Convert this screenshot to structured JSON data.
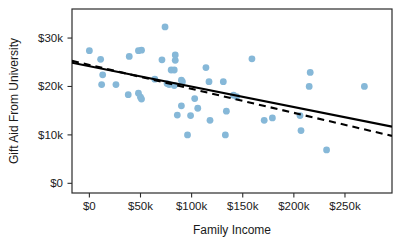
{
  "chart_data": {
    "type": "scatter",
    "title": "",
    "xlabel": "Family Income",
    "ylabel": "Gift Aid From University",
    "xlim": [
      -17000,
      296000
    ],
    "ylim": [
      -2000,
      36000
    ],
    "grid": false,
    "legend": null,
    "x_ticks": [
      0,
      50000,
      100000,
      150000,
      200000,
      250000
    ],
    "x_tick_labels": [
      "$0",
      "$50k",
      "$100k",
      "$150k",
      "$200k",
      "$250k"
    ],
    "y_ticks": [
      0,
      10000,
      20000,
      30000
    ],
    "y_tick_labels": [
      "$0",
      "$10k",
      "$20k",
      "$30k"
    ],
    "point_color": "#86b8d8",
    "point_radius": 3.4,
    "points": [
      {
        "x": 0,
        "y": 27400
      },
      {
        "x": 11000,
        "y": 25600
      },
      {
        "x": 13000,
        "y": 22400
      },
      {
        "x": 12000,
        "y": 20400
      },
      {
        "x": 26000,
        "y": 20400
      },
      {
        "x": 39000,
        "y": 26200
      },
      {
        "x": 38000,
        "y": 18300
      },
      {
        "x": 48000,
        "y": 27400
      },
      {
        "x": 51000,
        "y": 27500
      },
      {
        "x": 48000,
        "y": 18600
      },
      {
        "x": 50000,
        "y": 17800
      },
      {
        "x": 51000,
        "y": 17400
      },
      {
        "x": 64000,
        "y": 21500
      },
      {
        "x": 71000,
        "y": 25500
      },
      {
        "x": 74000,
        "y": 32300
      },
      {
        "x": 76000,
        "y": 20600
      },
      {
        "x": 78000,
        "y": 20400
      },
      {
        "x": 80000,
        "y": 23400
      },
      {
        "x": 83000,
        "y": 23400
      },
      {
        "x": 84000,
        "y": 26500
      },
      {
        "x": 84000,
        "y": 25400
      },
      {
        "x": 83000,
        "y": 20200
      },
      {
        "x": 86000,
        "y": 14100
      },
      {
        "x": 90000,
        "y": 21300
      },
      {
        "x": 91000,
        "y": 21000
      },
      {
        "x": 90000,
        "y": 16000
      },
      {
        "x": 96000,
        "y": 10000
      },
      {
        "x": 99000,
        "y": 14000
      },
      {
        "x": 103000,
        "y": 17500
      },
      {
        "x": 106000,
        "y": 15500
      },
      {
        "x": 114000,
        "y": 23900
      },
      {
        "x": 117000,
        "y": 21000
      },
      {
        "x": 118000,
        "y": 13000
      },
      {
        "x": 131000,
        "y": 21000
      },
      {
        "x": 133000,
        "y": 10000
      },
      {
        "x": 134000,
        "y": 14900
      },
      {
        "x": 141000,
        "y": 18200
      },
      {
        "x": 144000,
        "y": 17900
      },
      {
        "x": 159000,
        "y": 25700
      },
      {
        "x": 171000,
        "y": 13000
      },
      {
        "x": 179000,
        "y": 13500
      },
      {
        "x": 206000,
        "y": 14000
      },
      {
        "x": 207000,
        "y": 10900
      },
      {
        "x": 216000,
        "y": 22900
      },
      {
        "x": 215000,
        "y": 20000
      },
      {
        "x": 232000,
        "y": 6900
      },
      {
        "x": 269000,
        "y": 20000
      }
    ],
    "fit_lines": [
      {
        "name": "least-squares-fit",
        "style": "solid",
        "color": "#000000",
        "x_start": -17000,
        "y_start": 24900,
        "x_end": 296000,
        "y_end": 11700
      },
      {
        "name": "alternative-fit",
        "style": "dashed",
        "color": "#000000",
        "x_start": -17000,
        "y_start": 25300,
        "x_end": 296000,
        "y_end": 9800
      }
    ]
  }
}
